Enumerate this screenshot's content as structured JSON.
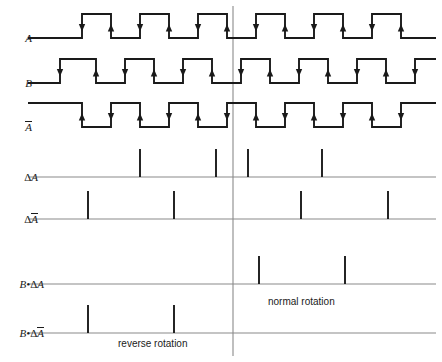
{
  "figure": {
    "type": "timing-diagram",
    "title": "",
    "width": 442,
    "height": 362,
    "background": "#ffffff",
    "wave_color": "#1a1a1a",
    "baseline_color": "#8a8a8a",
    "divider_color": "#8a8a8a"
  },
  "divider": {
    "name": "rotation-direction-divider",
    "x": 233,
    "y_top": 6,
    "y_bottom": 356
  },
  "annotations": [
    {
      "id": "reverse",
      "text": "reverse rotation",
      "x": 118,
      "y": 338
    },
    {
      "id": "normal",
      "text": "normal rotation",
      "x": 268,
      "y": 296
    }
  ],
  "rows": [
    {
      "id": "A",
      "label": "A",
      "label_overline": false,
      "label_delta": false,
      "label_x": 38,
      "kind": "square",
      "baseline_y": 38,
      "high_y": 14,
      "start_x": 28,
      "end_x": 436,
      "start_level": "low",
      "edges": [
        82,
        111,
        140,
        169,
        198,
        227,
        256,
        285,
        314,
        343,
        372,
        401
      ],
      "arrow_on_rising": "down",
      "arrow_on_falling": "up"
    },
    {
      "id": "B",
      "label": "B",
      "label_overline": false,
      "label_delta": false,
      "label_x": 38,
      "kind": "square",
      "baseline_y": 83,
      "high_y": 59,
      "start_x": 28,
      "end_x": 436,
      "start_level": "low",
      "edges": [
        60,
        96,
        125,
        154,
        183,
        212,
        241,
        270,
        299,
        328,
        357,
        386,
        415
      ],
      "arrow_on_rising": "down",
      "arrow_on_falling": "up"
    },
    {
      "id": "Abar",
      "label": "A",
      "label_overline": true,
      "label_delta": false,
      "label_x": 38,
      "kind": "square",
      "baseline_y": 127,
      "high_y": 103,
      "start_x": 28,
      "end_x": 436,
      "start_level": "high",
      "edges": [
        82,
        111,
        140,
        169,
        198,
        227,
        256,
        285,
        314,
        343,
        372,
        401
      ],
      "arrow_on_rising": "down",
      "arrow_on_falling": "up"
    },
    {
      "id": "dA",
      "label": "A",
      "label_overline": false,
      "label_delta": true,
      "label_x": 44,
      "kind": "pulse",
      "baseline_y": 177,
      "pulse_height": 28,
      "start_x": 28,
      "end_x": 436,
      "pulses": [
        140,
        216,
        248,
        322
      ]
    },
    {
      "id": "dAbar",
      "label": "A",
      "label_overline": true,
      "label_delta": true,
      "label_x": 44,
      "kind": "pulse",
      "baseline_y": 219,
      "pulse_height": 28,
      "start_x": 28,
      "end_x": 436,
      "pulses": [
        88,
        174,
        301,
        388
      ]
    },
    {
      "id": "BdA",
      "label": "A",
      "label_overline": false,
      "label_delta": true,
      "label_prefix": "B•",
      "label_x": 50,
      "kind": "pulse",
      "baseline_y": 284,
      "pulse_height": 28,
      "start_x": 28,
      "end_x": 436,
      "pulses": [
        259,
        345
      ]
    },
    {
      "id": "BdAbar",
      "label": "A",
      "label_overline": true,
      "label_delta": true,
      "label_prefix": "B•",
      "label_x": 50,
      "kind": "pulse",
      "baseline_y": 333,
      "pulse_height": 28,
      "start_x": 28,
      "end_x": 436,
      "pulses": [
        88,
        174
      ]
    }
  ]
}
